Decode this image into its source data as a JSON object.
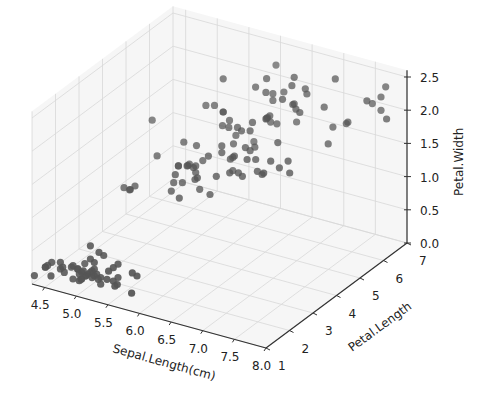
{
  "chart_data": {
    "type": "scatter3d",
    "title": "",
    "xlabel": "Sepal.Length(cm)",
    "ylabel": "Petal.Length",
    "zlabel": "Petal.Width",
    "xticks": [
      "4.5",
      "5.0",
      "5.5",
      "6.0",
      "6.5",
      "7.0",
      "7.5",
      "8.0"
    ],
    "yticks": [
      "1",
      "2",
      "3",
      "4",
      "5",
      "6",
      "7"
    ],
    "zticks": [
      "0.0",
      "0.5",
      "1.0",
      "1.5",
      "2.0",
      "2.5"
    ],
    "xlim": [
      4.3,
      8.0
    ],
    "ylim": [
      1.0,
      7.0
    ],
    "zlim": [
      0.0,
      2.6
    ],
    "marker_color": "#555555",
    "grid": true,
    "points": [
      [
        5.1,
        1.4,
        0.2
      ],
      [
        4.9,
        1.4,
        0.2
      ],
      [
        4.7,
        1.3,
        0.2
      ],
      [
        4.6,
        1.5,
        0.2
      ],
      [
        5.0,
        1.4,
        0.2
      ],
      [
        5.4,
        1.7,
        0.4
      ],
      [
        4.6,
        1.4,
        0.3
      ],
      [
        5.0,
        1.5,
        0.2
      ],
      [
        4.4,
        1.4,
        0.2
      ],
      [
        4.9,
        1.5,
        0.1
      ],
      [
        5.4,
        1.5,
        0.2
      ],
      [
        4.8,
        1.6,
        0.2
      ],
      [
        4.8,
        1.4,
        0.1
      ],
      [
        4.3,
        1.1,
        0.1
      ],
      [
        5.8,
        1.2,
        0.2
      ],
      [
        5.7,
        1.5,
        0.4
      ],
      [
        5.4,
        1.3,
        0.4
      ],
      [
        5.1,
        1.4,
        0.3
      ],
      [
        5.7,
        1.7,
        0.3
      ],
      [
        5.1,
        1.5,
        0.3
      ],
      [
        5.4,
        1.7,
        0.2
      ],
      [
        5.1,
        1.5,
        0.4
      ],
      [
        4.6,
        1.0,
        0.2
      ],
      [
        5.1,
        1.7,
        0.5
      ],
      [
        4.8,
        1.9,
        0.2
      ],
      [
        5.0,
        1.6,
        0.2
      ],
      [
        5.0,
        1.6,
        0.4
      ],
      [
        5.2,
        1.5,
        0.2
      ],
      [
        5.2,
        1.4,
        0.2
      ],
      [
        4.7,
        1.6,
        0.2
      ],
      [
        4.8,
        1.6,
        0.2
      ],
      [
        5.4,
        1.5,
        0.4
      ],
      [
        5.2,
        1.5,
        0.1
      ],
      [
        5.5,
        1.4,
        0.2
      ],
      [
        4.9,
        1.5,
        0.2
      ],
      [
        5.0,
        1.2,
        0.2
      ],
      [
        5.5,
        1.3,
        0.2
      ],
      [
        4.9,
        1.4,
        0.1
      ],
      [
        4.4,
        1.3,
        0.2
      ],
      [
        5.1,
        1.5,
        0.2
      ],
      [
        5.0,
        1.3,
        0.3
      ],
      [
        4.5,
        1.3,
        0.3
      ],
      [
        4.4,
        1.3,
        0.2
      ],
      [
        5.0,
        1.6,
        0.6
      ],
      [
        5.1,
        1.9,
        0.4
      ],
      [
        4.8,
        1.4,
        0.3
      ],
      [
        5.1,
        1.6,
        0.2
      ],
      [
        4.6,
        1.4,
        0.2
      ],
      [
        5.3,
        1.5,
        0.2
      ],
      [
        5.0,
        1.4,
        0.2
      ],
      [
        7.0,
        4.7,
        1.4
      ],
      [
        6.4,
        4.5,
        1.5
      ],
      [
        6.9,
        4.9,
        1.5
      ],
      [
        5.5,
        4.0,
        1.3
      ],
      [
        6.5,
        4.6,
        1.5
      ],
      [
        5.7,
        4.5,
        1.3
      ],
      [
        6.3,
        4.7,
        1.6
      ],
      [
        4.9,
        3.3,
        1.0
      ],
      [
        6.6,
        4.6,
        1.3
      ],
      [
        5.2,
        3.9,
        1.4
      ],
      [
        5.0,
        3.5,
        1.0
      ],
      [
        5.9,
        4.2,
        1.5
      ],
      [
        6.0,
        4.0,
        1.0
      ],
      [
        6.1,
        4.7,
        1.4
      ],
      [
        5.6,
        3.6,
        1.3
      ],
      [
        6.7,
        4.4,
        1.4
      ],
      [
        5.6,
        4.5,
        1.5
      ],
      [
        5.8,
        4.1,
        1.0
      ],
      [
        6.2,
        4.5,
        1.5
      ],
      [
        5.6,
        3.9,
        1.1
      ],
      [
        5.9,
        4.8,
        1.8
      ],
      [
        6.1,
        4.0,
        1.3
      ],
      [
        6.3,
        4.9,
        1.5
      ],
      [
        6.1,
        4.7,
        1.2
      ],
      [
        6.4,
        4.3,
        1.3
      ],
      [
        6.6,
        4.4,
        1.4
      ],
      [
        6.8,
        4.8,
        1.4
      ],
      [
        6.7,
        5.0,
        1.7
      ],
      [
        6.0,
        4.5,
        1.5
      ],
      [
        5.7,
        3.5,
        1.0
      ],
      [
        5.5,
        3.8,
        1.1
      ],
      [
        5.5,
        3.7,
        1.0
      ],
      [
        5.8,
        3.9,
        1.2
      ],
      [
        6.0,
        5.1,
        1.6
      ],
      [
        5.4,
        4.5,
        1.5
      ],
      [
        6.0,
        4.5,
        1.6
      ],
      [
        6.7,
        4.7,
        1.5
      ],
      [
        6.3,
        4.4,
        1.3
      ],
      [
        5.6,
        4.1,
        1.3
      ],
      [
        5.5,
        4.0,
        1.3
      ],
      [
        5.5,
        4.4,
        1.2
      ],
      [
        6.1,
        4.6,
        1.4
      ],
      [
        5.8,
        4.0,
        1.2
      ],
      [
        5.0,
        3.3,
        1.0
      ],
      [
        5.6,
        4.2,
        1.3
      ],
      [
        5.7,
        4.2,
        1.2
      ],
      [
        5.7,
        4.2,
        1.3
      ],
      [
        6.2,
        4.3,
        1.3
      ],
      [
        5.1,
        3.0,
        1.1
      ],
      [
        5.7,
        4.1,
        1.3
      ],
      [
        6.3,
        6.0,
        2.5
      ],
      [
        5.8,
        5.1,
        1.9
      ],
      [
        7.1,
        5.9,
        2.1
      ],
      [
        6.3,
        5.6,
        1.8
      ],
      [
        6.5,
        5.8,
        2.2
      ],
      [
        7.6,
        6.6,
        2.1
      ],
      [
        4.9,
        4.5,
        1.7
      ],
      [
        7.3,
        6.3,
        1.8
      ],
      [
        6.7,
        5.8,
        1.8
      ],
      [
        7.2,
        6.1,
        2.5
      ],
      [
        6.5,
        5.1,
        2.0
      ],
      [
        6.4,
        5.3,
        1.9
      ],
      [
        6.8,
        5.5,
        2.1
      ],
      [
        5.7,
        5.0,
        2.0
      ],
      [
        5.8,
        5.1,
        2.4
      ],
      [
        6.4,
        5.3,
        2.3
      ],
      [
        6.5,
        5.5,
        1.8
      ],
      [
        7.7,
        6.7,
        2.2
      ],
      [
        7.7,
        6.9,
        2.3
      ],
      [
        6.0,
        5.0,
        1.5
      ],
      [
        6.9,
        5.7,
        2.3
      ],
      [
        5.6,
        4.9,
        2.0
      ],
      [
        7.7,
        6.7,
        2.0
      ],
      [
        6.3,
        4.9,
        1.8
      ],
      [
        6.7,
        5.7,
        2.1
      ],
      [
        7.2,
        6.0,
        1.8
      ],
      [
        6.2,
        4.8,
        1.8
      ],
      [
        6.1,
        4.9,
        1.8
      ],
      [
        6.4,
        5.6,
        2.1
      ],
      [
        7.2,
        5.8,
        1.6
      ],
      [
        7.4,
        6.1,
        1.9
      ],
      [
        7.9,
        6.4,
        2.0
      ],
      [
        6.4,
        5.6,
        2.2
      ],
      [
        6.3,
        5.1,
        1.5
      ],
      [
        6.1,
        5.6,
        1.4
      ],
      [
        7.7,
        6.1,
        2.3
      ],
      [
        6.3,
        5.6,
        2.4
      ],
      [
        6.4,
        5.5,
        1.8
      ],
      [
        6.0,
        4.8,
        1.8
      ],
      [
        6.9,
        5.4,
        2.1
      ],
      [
        6.7,
        5.6,
        2.4
      ],
      [
        6.9,
        5.1,
        2.3
      ],
      [
        5.8,
        5.1,
        1.9
      ],
      [
        6.8,
        5.9,
        2.3
      ],
      [
        6.7,
        5.7,
        2.5
      ],
      [
        6.7,
        5.2,
        2.3
      ],
      [
        6.3,
        5.0,
        1.9
      ],
      [
        6.5,
        5.2,
        2.0
      ],
      [
        6.2,
        5.4,
        2.3
      ],
      [
        5.9,
        5.1,
        1.8
      ]
    ]
  }
}
